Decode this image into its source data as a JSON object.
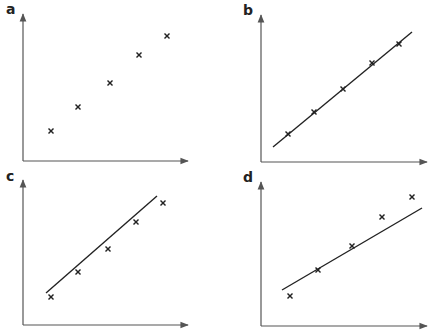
{
  "chart_data": [
    {
      "type": "scatter",
      "panel": "a",
      "title": "a",
      "xlabel": "",
      "ylabel": "",
      "grid": false,
      "has_fit_line": false,
      "points": [
        [
          51,
          131
        ],
        [
          78,
          107
        ],
        [
          110,
          83
        ],
        [
          139,
          55
        ],
        [
          167,
          36
        ]
      ],
      "axes": {
        "origin": [
          23,
          161
        ],
        "y_top": 14,
        "x_right": 188
      }
    },
    {
      "type": "scatter",
      "panel": "b",
      "title": "b",
      "xlabel": "",
      "ylabel": "",
      "grid": false,
      "has_fit_line": true,
      "fit_line": [
        [
          273,
          147
        ],
        [
          412,
          32
        ]
      ],
      "points": [
        [
          288,
          134
        ],
        [
          314,
          112
        ],
        [
          343,
          89
        ],
        [
          372,
          63
        ],
        [
          399,
          44
        ]
      ],
      "axes": {
        "origin": [
          261,
          162
        ],
        "y_top": 15,
        "x_right": 427
      }
    },
    {
      "type": "scatter",
      "panel": "c",
      "title": "c",
      "xlabel": "",
      "ylabel": "",
      "grid": false,
      "has_fit_line": true,
      "fit_line": [
        [
          46,
          293
        ],
        [
          157,
          196
        ]
      ],
      "points": [
        [
          51,
          297
        ],
        [
          78,
          272
        ],
        [
          108,
          249
        ],
        [
          136,
          222
        ],
        [
          163,
          203
        ]
      ],
      "axes": {
        "origin": [
          23,
          325
        ],
        "y_top": 180,
        "x_right": 188
      }
    },
    {
      "type": "scatter",
      "panel": "d",
      "title": "d",
      "xlabel": "",
      "ylabel": "",
      "grid": false,
      "has_fit_line": true,
      "fit_line": [
        [
          282,
          290
        ],
        [
          422,
          208
        ]
      ],
      "points": [
        [
          290,
          296
        ],
        [
          318,
          270
        ],
        [
          352,
          246
        ],
        [
          382,
          217
        ],
        [
          412,
          197
        ]
      ],
      "axes": {
        "origin": [
          261,
          326
        ],
        "y_top": 182,
        "x_right": 427
      }
    }
  ],
  "labels": {
    "a": "a",
    "b": "b",
    "c": "c",
    "d": "d"
  },
  "colors": {
    "axis": "#555555",
    "ink": "#222222",
    "background": "#ffffff"
  }
}
